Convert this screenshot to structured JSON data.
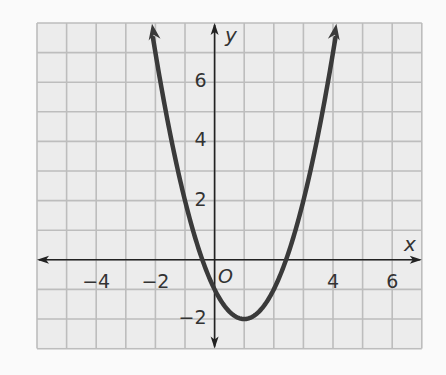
{
  "chart_data": {
    "type": "line",
    "title": "",
    "function": "y = (x - 1)^2 - 2",
    "xlabel": "x",
    "ylabel": "y",
    "origin_label": "O",
    "xlim": [
      -6,
      7
    ],
    "ylim": [
      -3,
      8
    ],
    "x_ticks": [
      -4,
      -2,
      4,
      6
    ],
    "x_tick_labels": [
      "−4",
      "−2",
      "4",
      "6"
    ],
    "y_ticks": [
      6,
      4,
      2,
      -2
    ],
    "y_tick_labels": [
      "6",
      "4",
      "2",
      "−2"
    ],
    "grid": true,
    "grid_step": 1,
    "series": [
      {
        "name": "parabola",
        "vertex": [
          1,
          -2
        ],
        "y_intercept": -1,
        "x_intercepts": [
          -0.41,
          2.41
        ],
        "x": [
          -2.16,
          -2,
          -1.5,
          -1,
          -0.5,
          0,
          0.5,
          1,
          1.5,
          2,
          2.5,
          3,
          3.5,
          4,
          4.16
        ],
        "y": [
          8,
          7,
          4.25,
          2,
          0.25,
          -1,
          -1.75,
          -2,
          -1.75,
          -1,
          0.25,
          2,
          4.25,
          7,
          8
        ]
      }
    ],
    "colors": {
      "curve": "#3a3a3a",
      "axis": "#222222",
      "grid": "#bdbdbd",
      "grid_bg": "#ebebeb"
    }
  }
}
